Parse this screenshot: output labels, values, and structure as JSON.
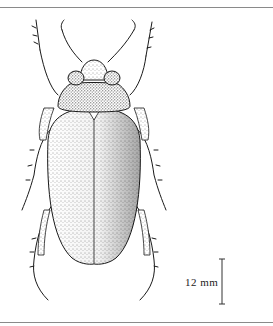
{
  "figure": {
    "scale_bar": {
      "label": "12 mm"
    }
  },
  "colors": {
    "ink": "#1a1a1a",
    "rule": "#8a8a8a",
    "background": "#ffffff"
  }
}
